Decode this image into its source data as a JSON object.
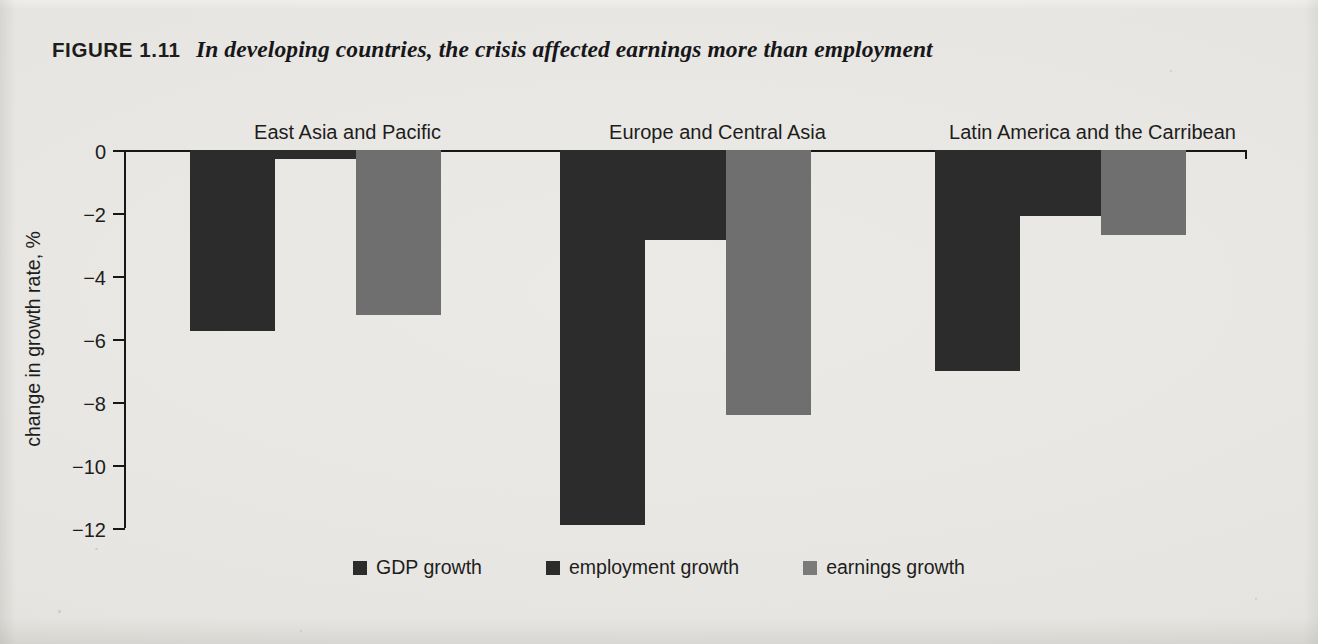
{
  "title": {
    "figure_number": "FIGURE 1.11",
    "caption": "In developing countries, the crisis affected earnings more than employment"
  },
  "axis": {
    "ylabel": "change in growth rate, %",
    "yticks": [
      "0",
      "−2",
      "−4",
      "−6",
      "−8",
      "−10",
      "−12"
    ]
  },
  "legend": {
    "items": [
      {
        "label": "GDP growth",
        "color": "#2c2c2c",
        "key": "gdp"
      },
      {
        "label": "employment growth",
        "color": "#2c2c2c",
        "key": "emp"
      },
      {
        "label": "earnings growth",
        "color": "#7b7b7b",
        "key": "earn"
      }
    ]
  },
  "chart_data": {
    "type": "bar",
    "title": "In developing countries, the crisis affected earnings more than employment",
    "xlabel": "",
    "ylabel": "change in growth rate, %",
    "ylim": [
      -12,
      0
    ],
    "ytick_values": [
      0,
      -2,
      -4,
      -6,
      -8,
      -10,
      -12
    ],
    "grid": false,
    "legend_position": "bottom",
    "orientation": "vertical-downward",
    "categories": [
      "East Asia and Pacific",
      "Europe and Central Asia",
      "Latin America and the Carribean"
    ],
    "series": [
      {
        "name": "GDP growth",
        "color": "#2c2c2c",
        "values": [
          -5.75,
          -11.9,
          -7.0
        ]
      },
      {
        "name": "employment growth",
        "color": "#2c2c2c",
        "values": [
          -0.3,
          -2.85,
          -2.1
        ]
      },
      {
        "name": "earnings growth",
        "color": "#6f6f6f",
        "values": [
          -5.25,
          -8.4,
          -2.7
        ]
      }
    ]
  }
}
